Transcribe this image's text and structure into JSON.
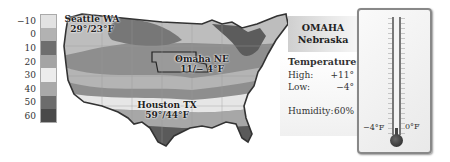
{
  "legend": {
    "items": [
      {
        "label": "−10",
        "color": "#e2e2e2"
      },
      {
        "label": "0",
        "color": "#b2b2b2"
      },
      {
        "label": "10",
        "color": "#6e6e6e"
      },
      {
        "label": "20",
        "color": "#a4a4a4"
      },
      {
        "label": "30",
        "color": "#ececec"
      },
      {
        "label": "40",
        "color": "#a9a9a9"
      },
      {
        "label": "50",
        "color": "#6c6c6c"
      },
      {
        "label": "60",
        "color": "#4a4a4a"
      }
    ]
  },
  "map": {
    "cities": [
      {
        "name": "Seattle WA",
        "temps": "29°/23°F"
      },
      {
        "name": "Omaha NE",
        "temps": "11/− 4°F"
      },
      {
        "name": "Houston TX",
        "temps": "59°/44°F"
      }
    ]
  },
  "info": {
    "city": "OMAHA",
    "state": "Nebraska",
    "temperature_label": "Temperature:",
    "high_label": "High:",
    "high_value": "+11°",
    "low_label": "Low:",
    "low_value": "−4°",
    "humidity_label": "Humidity:",
    "humidity_value": "60%"
  },
  "thermometer": {
    "left_label": "−4°F",
    "right_label": "0°F"
  }
}
